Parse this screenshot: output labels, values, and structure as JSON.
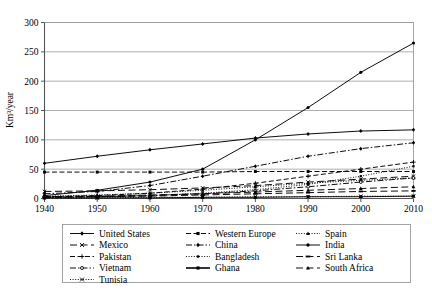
{
  "chart_data": {
    "type": "line",
    "title": "",
    "xlabel": "",
    "ylabel": "Km³/year",
    "x": [
      1940,
      1950,
      1960,
      1970,
      1980,
      1990,
      2000,
      2010
    ],
    "xticklabels": [
      "1940",
      "1950",
      "1960",
      "1970",
      "1980",
      "1990",
      "2000",
      "2010"
    ],
    "yticklabels": [
      "0",
      "50",
      "100",
      "150",
      "200",
      "250",
      "300"
    ],
    "yticks": [
      0,
      50,
      100,
      150,
      200,
      250,
      300
    ],
    "ylim": [
      0,
      300
    ],
    "xlim": [
      1940,
      2010
    ],
    "grid": "horizontal",
    "legend_position": "bottom",
    "legend_columns": 3,
    "series": [
      {
        "name": "United States",
        "values": [
          60,
          72,
          83,
          93,
          103,
          110,
          115,
          117
        ],
        "marker": "diamond",
        "dash": "solid",
        "color": "#000000"
      },
      {
        "name": "Western Europe",
        "values": [
          45,
          45,
          45,
          45,
          46,
          46,
          46,
          46
        ],
        "marker": "square",
        "dash": "dashed",
        "color": "#000000"
      },
      {
        "name": "Spain",
        "values": [
          4,
          6,
          9,
          14,
          20,
          26,
          31,
          35
        ],
        "marker": "triangle",
        "dash": "dotted",
        "color": "#000000"
      },
      {
        "name": "Mexico",
        "values": [
          12,
          13,
          15,
          18,
          22,
          28,
          33,
          38
        ],
        "marker": "cross",
        "dash": "longdash",
        "color": "#000000"
      },
      {
        "name": "China",
        "values": [
          8,
          12,
          22,
          38,
          55,
          72,
          85,
          95
        ],
        "marker": "diamond",
        "dash": "dashdot",
        "color": "#000000"
      },
      {
        "name": "India",
        "values": [
          5,
          14,
          28,
          50,
          100,
          155,
          215,
          265
        ],
        "marker": "circle",
        "dash": "solid",
        "color": "#000000"
      },
      {
        "name": "Pakistan",
        "values": [
          3,
          5,
          9,
          16,
          26,
          38,
          50,
          62
        ],
        "marker": "plus",
        "dash": "dashed",
        "color": "#000000"
      },
      {
        "name": "Bangladesh",
        "values": [
          2,
          3,
          5,
          9,
          15,
          24,
          38,
          55
        ],
        "marker": "smallsquare",
        "dash": "dotted",
        "color": "#000000"
      },
      {
        "name": "Sri Lanka",
        "values": [
          2,
          3,
          4,
          6,
          8,
          10,
          12,
          13
        ],
        "marker": "dash",
        "dash": "longdash",
        "color": "#000000"
      },
      {
        "name": "Vietnam",
        "values": [
          2,
          3,
          5,
          8,
          13,
          20,
          28,
          35
        ],
        "marker": "opencircle",
        "dash": "dashdot",
        "color": "#000000"
      },
      {
        "name": "Ghana",
        "values": [
          1,
          1,
          1,
          2,
          2,
          3,
          3,
          4
        ],
        "marker": "square",
        "dash": "solid",
        "color": "#000000"
      },
      {
        "name": "South Africa",
        "values": [
          3,
          4,
          6,
          8,
          11,
          14,
          17,
          20
        ],
        "marker": "triangle",
        "dash": "longdash",
        "color": "#000000"
      },
      {
        "name": "Tunisia",
        "values": [
          1,
          1,
          2,
          2,
          3,
          3,
          4,
          4
        ],
        "marker": "cross",
        "dash": "dotted",
        "color": "#000000"
      }
    ],
    "legend_order": [
      "United States",
      "Western Europe",
      "Spain",
      "Mexico",
      "China",
      "India",
      "Pakistan",
      "Bangladesh",
      "Sri Lanka",
      "Vietnam",
      "Ghana",
      "South Africa",
      "Tunisia"
    ]
  }
}
